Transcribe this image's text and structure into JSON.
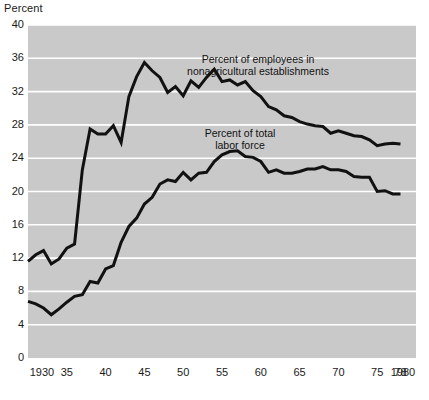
{
  "chart_data": {
    "type": "line",
    "title": "",
    "subtitle": "",
    "ylabel": "Percent",
    "xlabel": "",
    "ylim": [
      0,
      40
    ],
    "xlim": [
      1930,
      1980
    ],
    "grid": true,
    "legend_position": "inline-annotation",
    "y_ticks": [
      "40",
      "36",
      "32",
      "28",
      "24",
      "20",
      "16",
      "12",
      "8",
      "4",
      "0"
    ],
    "y_tick_values": [
      40,
      36,
      32,
      28,
      24,
      20,
      16,
      12,
      8,
      4,
      0
    ],
    "x_ticks": [
      "1930",
      "35",
      "40",
      "45",
      "50",
      "55",
      "60",
      "65",
      "70",
      "75",
      "78",
      "1980"
    ],
    "x_tick_values": [
      1930,
      1935,
      1940,
      1945,
      1950,
      1955,
      1960,
      1965,
      1970,
      1975,
      1978,
      1980
    ],
    "background_color": "#c9c9c9",
    "gridline_color": "#ffffff",
    "line_color": "#111111",
    "annotations": [
      {
        "name": "nonagricultural-label",
        "line1": "Percent of employees in",
        "line2": "nonagricultural establishments",
        "x_px": 258,
        "y_px": 53
      },
      {
        "name": "total-labor-force-label",
        "line1": "Percent of total",
        "line2": "labor force",
        "x_px": 240,
        "y_px": 127
      }
    ],
    "series": [
      {
        "name": "Percent of employees in nonagricultural establishments",
        "x": [
          1930,
          1931,
          1932,
          1933,
          1934,
          1935,
          1936,
          1937,
          1938,
          1939,
          1940,
          1941,
          1942,
          1943,
          1944,
          1945,
          1946,
          1947,
          1948,
          1949,
          1950,
          1951,
          1952,
          1953,
          1954,
          1955,
          1956,
          1957,
          1958,
          1959,
          1960,
          1961,
          1962,
          1963,
          1964,
          1965,
          1966,
          1967,
          1968,
          1969,
          1970,
          1971,
          1972,
          1973,
          1974,
          1975,
          1976,
          1977,
          1978
        ],
        "values": [
          11.6,
          12.4,
          12.9,
          11.3,
          11.9,
          13.2,
          13.7,
          22.6,
          27.5,
          26.9,
          26.9,
          27.9,
          25.9,
          31.4,
          33.8,
          35.5,
          34.5,
          33.7,
          31.9,
          32.6,
          31.5,
          33.3,
          32.5,
          33.7,
          34.7,
          33.2,
          33.4,
          32.8,
          33.2,
          32.1,
          31.4,
          30.2,
          29.8,
          29.1,
          28.9,
          28.4,
          28.1,
          27.9,
          27.8,
          27.0,
          27.3,
          27.0,
          26.7,
          26.6,
          26.2,
          25.5,
          25.7,
          25.8,
          25.7
        ]
      },
      {
        "name": "Percent of total labor force",
        "x": [
          1930,
          1931,
          1932,
          1933,
          1934,
          1935,
          1936,
          1937,
          1938,
          1939,
          1940,
          1941,
          1942,
          1943,
          1944,
          1945,
          1946,
          1947,
          1948,
          1949,
          1950,
          1951,
          1952,
          1953,
          1954,
          1955,
          1956,
          1957,
          1958,
          1959,
          1960,
          1961,
          1962,
          1963,
          1964,
          1965,
          1966,
          1967,
          1968,
          1969,
          1970,
          1971,
          1972,
          1973,
          1974,
          1975,
          1976,
          1977,
          1978
        ],
        "values": [
          6.8,
          6.5,
          6.0,
          5.2,
          5.9,
          6.7,
          7.4,
          7.6,
          9.2,
          9.0,
          10.7,
          11.1,
          13.9,
          15.8,
          16.8,
          18.5,
          19.3,
          20.9,
          21.4,
          21.2,
          22.3,
          21.4,
          22.2,
          22.3,
          23.6,
          24.4,
          24.8,
          24.9,
          24.2,
          24.1,
          23.6,
          22.3,
          22.6,
          22.2,
          22.2,
          22.4,
          22.7,
          22.7,
          23.0,
          22.6,
          22.6,
          22.4,
          21.8,
          21.7,
          21.7,
          20.0,
          20.1,
          19.7,
          19.7
        ]
      }
    ]
  },
  "plot_geometry": {
    "left_px": 28,
    "right_px": 416,
    "top_px": 25,
    "bottom_px": 358
  }
}
